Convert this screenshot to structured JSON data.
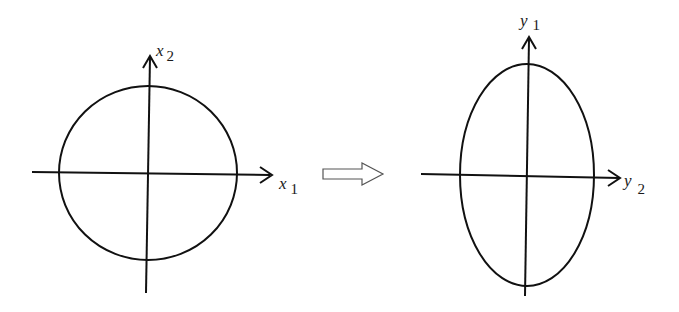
{
  "left_diagram": {
    "shape": "circle",
    "x_axis_label": {
      "var": "x",
      "sub": "1"
    },
    "y_axis_label": {
      "var": "x",
      "sub": "2"
    }
  },
  "transform_arrow": {
    "icon": "hollow-right-arrow-icon"
  },
  "right_diagram": {
    "shape": "ellipse",
    "x_axis_label": {
      "var": "y",
      "sub": "2"
    },
    "y_axis_label": {
      "var": "y",
      "sub": "1"
    }
  },
  "colors": {
    "stroke": "#111111",
    "background": "#ffffff"
  }
}
